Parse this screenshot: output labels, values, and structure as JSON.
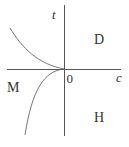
{
  "diagram": {
    "axes": {
      "vertical_label": "t",
      "horizontal_label": "c",
      "origin_label": "0"
    },
    "regions": {
      "upper_right": "D",
      "left": "M",
      "lower_right": "H"
    },
    "colors": {
      "axis": "#555555",
      "curve": "#666666",
      "text": "#333333",
      "background": "#ffffff"
    }
  }
}
